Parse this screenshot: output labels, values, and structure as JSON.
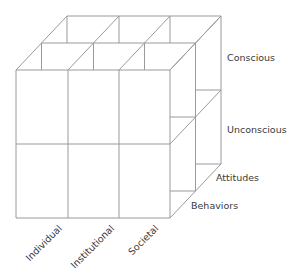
{
  "diagram": {
    "type": "3d-cube-matrix",
    "line_color": "#9a9a9a",
    "text_color": "#3a3a3a",
    "geometry": {
      "front": {
        "x": [
          16,
          68,
          119,
          170
        ],
        "y": [
          70,
          144,
          218
        ]
      },
      "depth_offset": {
        "dx": 25.5,
        "dy": -27
      },
      "depth_layers": 3
    },
    "axes": {
      "columns": [
        "Individual",
        "Institutional",
        "Societal"
      ],
      "rows": [
        "Conscious",
        "Unconscious"
      ],
      "depth": [
        "Behaviors",
        "Attitudes"
      ]
    }
  },
  "labels": {
    "conscious": "Conscious",
    "unconscious": "Unconscious",
    "attitudes": "Attitudes",
    "behaviors": "Behaviors",
    "individual": "Individual",
    "institutional": "Institutional",
    "societal": "Societal"
  }
}
